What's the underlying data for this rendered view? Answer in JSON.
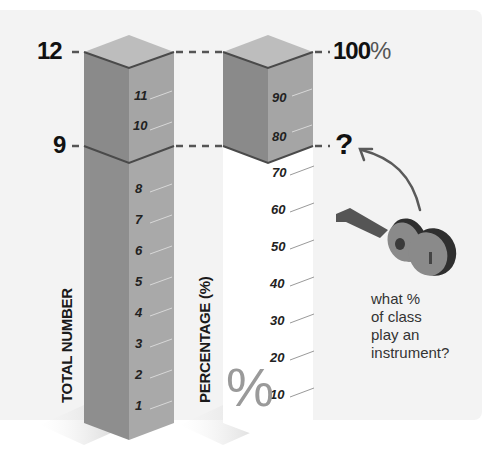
{
  "left_column": {
    "axis_label": "TOTAL NUMBER",
    "top_value": "12",
    "marker_value": "9",
    "ticks": [
      "1",
      "2",
      "3",
      "4",
      "5",
      "6",
      "7",
      "8",
      "10",
      "11"
    ]
  },
  "right_column": {
    "axis_label": "PERCENTAGE (%)",
    "top_value_number": "100",
    "top_value_unit": "%",
    "marker_value": "?",
    "ticks": [
      "10",
      "20",
      "30",
      "40",
      "50",
      "60",
      "70",
      "80",
      "90"
    ],
    "watermark_symbol": "%"
  },
  "annotation": {
    "icon": "guitar-icon",
    "caption_lines": [
      "what %",
      "of class",
      "play an",
      "instrument?"
    ]
  },
  "colors": {
    "background_panel": "#f3f3f3",
    "box_left_face": "#8c8c8c",
    "box_right_face": "#a7a7a7",
    "box_top_face": "#bcbcbc",
    "edge": "#4a4a4a",
    "empty_column": "#ffffff",
    "arrow": "#5a5a5a"
  }
}
